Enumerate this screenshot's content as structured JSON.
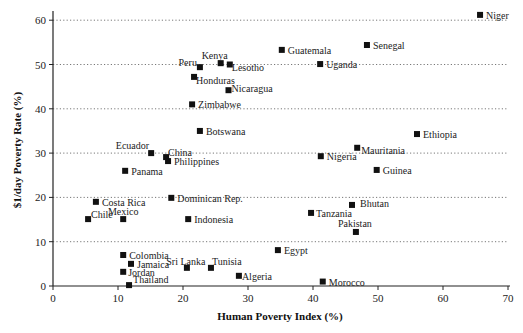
{
  "chart_data": {
    "type": "scatter",
    "title": "",
    "xlabel": "Human Poverty Index (%)",
    "ylabel": "$1/day Poverty Rate (%)",
    "xlim": [
      0,
      70
    ],
    "ylim": [
      0,
      62
    ],
    "xticks": [
      0,
      10,
      20,
      30,
      40,
      50,
      60,
      70
    ],
    "yticks": [
      0,
      10,
      20,
      30,
      40,
      50,
      60
    ],
    "grid": "horizontal dotted",
    "legend": "none",
    "marker": "square",
    "points": [
      {
        "label": "Niger",
        "x": 65.7,
        "y": 61.2,
        "lx": 6,
        "ly": 4,
        "anchor": "start"
      },
      {
        "label": "Senegal",
        "x": 48.3,
        "y": 54.4,
        "lx": 6,
        "ly": 4,
        "anchor": "start"
      },
      {
        "label": "Guatemala",
        "x": 35.2,
        "y": 53.3,
        "lx": 6,
        "ly": 4,
        "anchor": "start"
      },
      {
        "label": "Uganda",
        "x": 41.1,
        "y": 50.1,
        "lx": 6,
        "ly": 4,
        "anchor": "start"
      },
      {
        "label": "Kenya",
        "x": 25.8,
        "y": 50.3,
        "lx": -6,
        "ly": -4,
        "anchor": "middle"
      },
      {
        "label": "Lesotho",
        "x": 27.2,
        "y": 50.0,
        "lx": 2,
        "ly": 6,
        "anchor": "start"
      },
      {
        "label": "Peru",
        "x": 22.6,
        "y": 49.4,
        "lx": -3,
        "ly": -1,
        "anchor": "end"
      },
      {
        "label": "Honduras",
        "x": 21.7,
        "y": 47.2,
        "lx": 2,
        "ly": 7,
        "anchor": "start"
      },
      {
        "label": "Nicaragua",
        "x": 27.0,
        "y": 44.2,
        "lx": 3,
        "ly": 2,
        "anchor": "start"
      },
      {
        "label": "Zimbabwe",
        "x": 21.4,
        "y": 41.0,
        "lx": 6,
        "ly": 4,
        "anchor": "start"
      },
      {
        "label": "Botswana",
        "x": 22.6,
        "y": 35.0,
        "lx": 6,
        "ly": 4,
        "anchor": "start"
      },
      {
        "label": "Ethiopia",
        "x": 56.0,
        "y": 34.3,
        "lx": 6,
        "ly": 4,
        "anchor": "start"
      },
      {
        "label": "Mauritania",
        "x": 46.8,
        "y": 31.2,
        "lx": 4,
        "ly": 6,
        "anchor": "start"
      },
      {
        "label": "Ecuador",
        "x": 15.1,
        "y": 30.0,
        "lx": -2,
        "ly": -4,
        "anchor": "end"
      },
      {
        "label": "China",
        "x": 17.4,
        "y": 29.1,
        "lx": 2,
        "ly": -1,
        "anchor": "start"
      },
      {
        "label": "Nigeria",
        "x": 41.2,
        "y": 29.3,
        "lx": 6,
        "ly": 4,
        "anchor": "start"
      },
      {
        "label": "Philippines",
        "x": 17.7,
        "y": 28.2,
        "lx": 6,
        "ly": 4,
        "anchor": "start"
      },
      {
        "label": "Panama",
        "x": 11.1,
        "y": 26.0,
        "lx": 6,
        "ly": 4,
        "anchor": "start"
      },
      {
        "label": "Guinea",
        "x": 49.8,
        "y": 26.2,
        "lx": 6,
        "ly": 4,
        "anchor": "start"
      },
      {
        "label": "Dominican Rep.",
        "x": 18.2,
        "y": 19.9,
        "lx": 6,
        "ly": 4,
        "anchor": "start"
      },
      {
        "label": "Costa Rica",
        "x": 6.6,
        "y": 19.0,
        "lx": 6,
        "ly": 4,
        "anchor": "start"
      },
      {
        "label": "Bhutan",
        "x": 46.0,
        "y": 18.3,
        "lx": 8,
        "ly": 2,
        "anchor": "start"
      },
      {
        "label": "Tanzania",
        "x": 39.7,
        "y": 16.5,
        "lx": 5,
        "ly": 4,
        "anchor": "start"
      },
      {
        "label": "Chile",
        "x": 5.4,
        "y": 15.1,
        "lx": 3,
        "ly": -1,
        "anchor": "start"
      },
      {
        "label": "Mexico",
        "x": 10.8,
        "y": 15.1,
        "lx": 0,
        "ly": -4,
        "anchor": "middle"
      },
      {
        "label": "Indonesia",
        "x": 20.8,
        "y": 15.1,
        "lx": 6,
        "ly": 4,
        "anchor": "start"
      },
      {
        "label": "Pakistan",
        "x": 46.6,
        "y": 12.2,
        "lx": -1,
        "ly": -5,
        "anchor": "middle"
      },
      {
        "label": "Egypt",
        "x": 34.6,
        "y": 8.1,
        "lx": 6,
        "ly": 4,
        "anchor": "start"
      },
      {
        "label": "Colombia",
        "x": 10.8,
        "y": 7.0,
        "lx": 6,
        "ly": 4,
        "anchor": "start"
      },
      {
        "label": "Jamaica",
        "x": 12.0,
        "y": 5.0,
        "lx": 6,
        "ly": 4,
        "anchor": "start"
      },
      {
        "label": "Sri Lanka",
        "x": 20.6,
        "y": 4.1,
        "lx": -1,
        "ly": -3,
        "anchor": "middle"
      },
      {
        "label": "Tunisia",
        "x": 24.3,
        "y": 4.1,
        "lx": 1,
        "ly": -3,
        "anchor": "start"
      },
      {
        "label": "Jordan",
        "x": 10.8,
        "y": 3.2,
        "lx": 5,
        "ly": 4,
        "anchor": "start"
      },
      {
        "label": "Algeria",
        "x": 28.6,
        "y": 2.3,
        "lx": 3,
        "ly": 4,
        "anchor": "start"
      },
      {
        "label": "Morocco",
        "x": 41.5,
        "y": 1.0,
        "lx": 6,
        "ly": 4,
        "anchor": "start"
      },
      {
        "label": "Thailand",
        "x": 11.7,
        "y": 0.2,
        "lx": 4,
        "ly": -2,
        "anchor": "start"
      }
    ]
  },
  "plot_area": {
    "x0": 53,
    "x1": 508,
    "y0": 286,
    "yTop": 11,
    "xPerUnit": 6.5,
    "yPerUnit": 4.43
  }
}
